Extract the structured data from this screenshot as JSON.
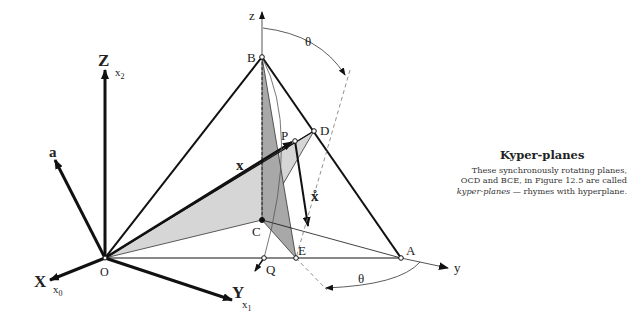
{
  "figure": {
    "axes": {
      "X": {
        "label": "X",
        "sub": "x",
        "sub_index": "0"
      },
      "Y": {
        "label": "Y",
        "sub": "x",
        "sub_index": "1"
      },
      "Z": {
        "label": "Z",
        "sub": "x",
        "sub_index": "2"
      },
      "z": "z",
      "y": "y"
    },
    "vectors": {
      "a": "a",
      "x": "x",
      "xdot": "x̊"
    },
    "points": {
      "O": "O",
      "B": "B",
      "A": "A",
      "C": "C",
      "D": "D",
      "E": "E",
      "P": "P",
      "Q": "Q"
    },
    "angles": {
      "theta_top": "θ",
      "theta_bottom": "θ"
    },
    "planes": [
      "OCD",
      "BCE"
    ],
    "colors": {
      "line": "#111111",
      "plane_light": "#d4d4d4",
      "plane_dark": "#a9a9a9"
    }
  },
  "sidebar": {
    "title": "Kyper-planes",
    "text_1": "These synchronously rotating planes, OCD and BCE, in Figure 12.5 are called ",
    "text_em": "kyper-planes",
    "text_2": " — rhymes with hyperplane."
  }
}
